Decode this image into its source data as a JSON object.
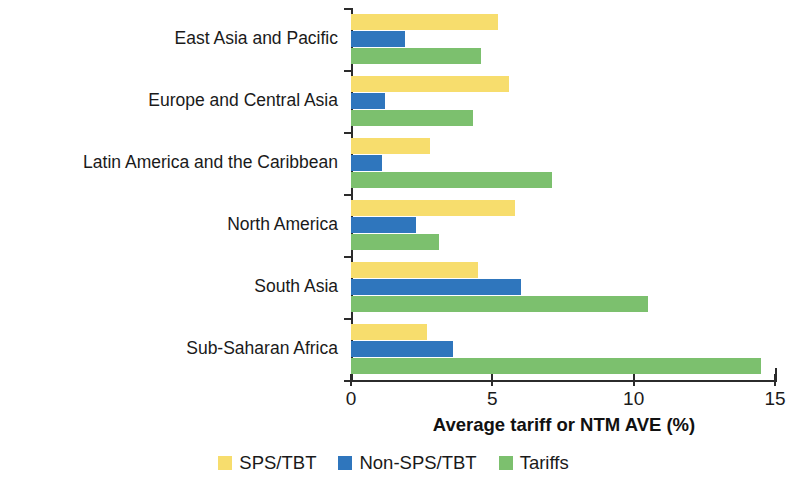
{
  "chart_data": {
    "type": "bar",
    "orientation": "horizontal",
    "title": "",
    "xlabel": "Average tariff or NTM AVE (%)",
    "ylabel": "",
    "xlim": [
      0,
      15
    ],
    "xticks": [
      0,
      5,
      10,
      15
    ],
    "xticklabels": [
      "0",
      "5",
      "10",
      "15"
    ],
    "grid": false,
    "legend_position": "bottom",
    "categories": [
      "East Asia and Pacific",
      "Europe and Central Asia",
      "Latin America and the Caribbean",
      "North America",
      "South Asia",
      "Sub-Saharan Africa"
    ],
    "series": [
      {
        "name": "SPS/TBT",
        "color": "#f7dd6d",
        "values": [
          5.2,
          5.6,
          2.8,
          5.8,
          4.5,
          2.7
        ]
      },
      {
        "name": "Non-SPS/TBT",
        "color": "#2f76bd",
        "values": [
          1.9,
          1.2,
          1.1,
          2.3,
          6.0,
          3.6
        ]
      },
      {
        "name": "Tariffs",
        "color": "#7cc06e",
        "values": [
          4.6,
          4.3,
          7.1,
          3.1,
          10.5,
          14.5
        ]
      }
    ]
  },
  "legend": {
    "items": [
      {
        "label": "SPS/TBT",
        "color": "#f7dd6d"
      },
      {
        "label": "Non-SPS/TBT",
        "color": "#2f76bd"
      },
      {
        "label": "Tariffs",
        "color": "#7cc06e"
      }
    ]
  },
  "axis": {
    "x_title": "Average tariff or NTM AVE (%)"
  }
}
